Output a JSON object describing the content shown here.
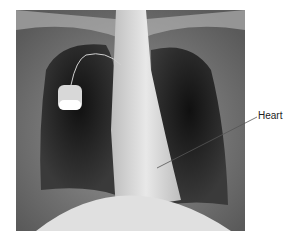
{
  "figure": {
    "label": "Heart"
  }
}
